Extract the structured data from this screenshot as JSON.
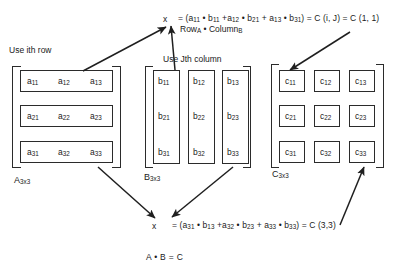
{
  "diagram": {
    "title_equation_top": {
      "x_symbol": "x",
      "text": "= (a11 • b11 +a12 • b21 + a13 • b31) = C (i, J) = C (1, 1)",
      "subnote": "RowA • ColumnB"
    },
    "title_equation_bottom": {
      "x_symbol": "x",
      "text": "= (a31 • b13 +a32 • b23 + a33 • b33) = C (3,3)"
    },
    "product_label": "A • B = C",
    "hints": {
      "row_hint": "Use ith row",
      "column_hint": "Use Jth column"
    },
    "matrices": [
      {
        "name": "A",
        "label": "A3x3",
        "label_base": "A",
        "label_sub": "3x3",
        "grouping": "rows",
        "cells": [
          [
            "a11",
            "a12",
            "a13"
          ],
          [
            "a21",
            "a22",
            "a23"
          ],
          [
            "a31",
            "a32",
            "a33"
          ]
        ]
      },
      {
        "name": "B",
        "label": "B3x3",
        "label_base": "B",
        "label_sub": "3x3",
        "grouping": "columns",
        "cells": [
          [
            "b11",
            "b12",
            "b13"
          ],
          [
            "b21",
            "b22",
            "b23"
          ],
          [
            "b31",
            "b32",
            "b33"
          ]
        ]
      },
      {
        "name": "C",
        "label": "C3x3",
        "label_base": "C",
        "label_sub": "3x3",
        "grouping": "individual",
        "cells": [
          [
            "c11",
            "c12",
            "c13"
          ],
          [
            "c21",
            "c22",
            "c23"
          ],
          [
            "c31",
            "c32",
            "c33"
          ]
        ]
      }
    ],
    "arrows": [
      {
        "name": "arrow-a-row1-to-top-equation",
        "from": "A row 1",
        "to": "top x"
      },
      {
        "name": "arrow-b-col1-to-top-equation",
        "from": "B column 1",
        "to": "top x"
      },
      {
        "name": "arrow-top-equation-to-c11",
        "from": "top equation",
        "to": "c11"
      },
      {
        "name": "arrow-a-row3-to-bottom-equation",
        "from": "A row 3",
        "to": "bottom x"
      },
      {
        "name": "arrow-b-col3-to-bottom-equation",
        "from": "B column 3",
        "to": "bottom x"
      },
      {
        "name": "arrow-c33-to-bottom-equation",
        "from": "bottom equation",
        "to": "c33"
      }
    ],
    "colors": {
      "ink": "#1a1a1a",
      "stroke": "#2b2b2b",
      "background": "#ffffff"
    }
  }
}
